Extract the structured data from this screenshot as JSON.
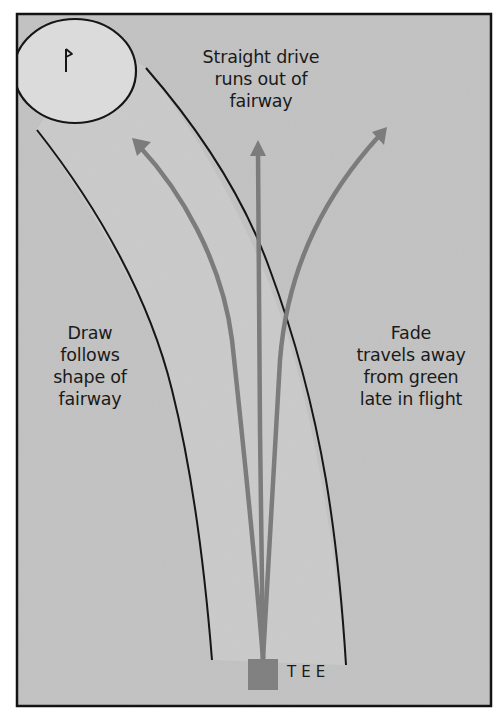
{
  "diagram": {
    "colors": {
      "background": "#c2c2c2",
      "fairway": "#cacaca",
      "green": "#dcdcdc",
      "outline": "#111111",
      "arrow": "#7a7a7a",
      "tee": "#7f7f7f"
    },
    "green": {
      "flag_icon": "flag-icon"
    },
    "labels": {
      "straight": [
        "Straight drive",
        "runs out of",
        "fairway"
      ],
      "draw": [
        "Draw",
        "follows",
        "shape of",
        "fairway"
      ],
      "fade": [
        "Fade",
        "travels away",
        "from green",
        "late in flight"
      ],
      "tee": "TEE"
    },
    "shots": [
      {
        "name": "draw",
        "direction": "curves left toward green"
      },
      {
        "name": "straight",
        "direction": "straight up"
      },
      {
        "name": "fade",
        "direction": "curves right away from green"
      }
    ]
  }
}
